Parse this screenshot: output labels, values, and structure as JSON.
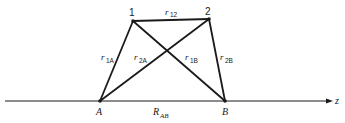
{
  "diagram": {
    "points": {
      "p1": {
        "label": "1",
        "x": 133,
        "y": 21
      },
      "p2": {
        "label": "2",
        "x": 209,
        "y": 19
      },
      "A": {
        "label": "A",
        "x": 100,
        "y": 101
      },
      "B": {
        "label": "B",
        "x": 225,
        "y": 101
      }
    },
    "edges": [
      {
        "from": "p1",
        "to": "p2",
        "label_base": "r",
        "label_sub": "12"
      },
      {
        "from": "p1",
        "to": "A",
        "label_base": "r",
        "label_sub": "1A"
      },
      {
        "from": "p2",
        "to": "A",
        "label_base": "r",
        "label_sub": "2A"
      },
      {
        "from": "p1",
        "to": "B",
        "label_base": "r",
        "label_sub": "1B"
      },
      {
        "from": "p2",
        "to": "B",
        "label_base": "r",
        "label_sub": "2B"
      }
    ],
    "axis": {
      "label": "z",
      "distance_label_base": "R",
      "distance_label_sub": "AB"
    },
    "colors": {
      "line": "#1a1a1a",
      "background": "#ffffff"
    }
  }
}
